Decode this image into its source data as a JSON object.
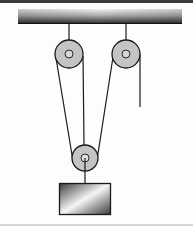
{
  "diagram": {
    "type": "pulley-system",
    "background": "#fdfdfd",
    "colors": {
      "top_border": "#3a3a3a",
      "ceiling_dark": "#2a2a2a",
      "ceiling_light": "#f0f0f0",
      "rope": "#1a1a1a",
      "pulley_fill": "#c4c4c4",
      "pulley_stroke": "#1a1a1a",
      "axle_fill": "#d8d8d8",
      "block_dark": "#3c3c3c",
      "block_light": "#f4f4f4",
      "bottom_line": "#9a9a9a"
    },
    "ceiling": {
      "x": 18,
      "y": 8,
      "width": 164,
      "height": 16
    },
    "pulleys": [
      {
        "name": "fixed-pulley-left",
        "cx": 69,
        "cy": 54,
        "r": 14,
        "axle_r": 4
      },
      {
        "name": "fixed-pulley-right",
        "cx": 126,
        "cy": 54,
        "r": 14,
        "axle_r": 4
      },
      {
        "name": "movable-pulley",
        "cx": 85,
        "cy": 158,
        "r": 13,
        "axle_r": 4
      }
    ],
    "block": {
      "x": 59,
      "y": 183,
      "width": 52,
      "height": 32
    },
    "elements": {
      "ceiling_label": "ceiling",
      "block_label": "load block",
      "free_end_label": "free rope end"
    }
  }
}
